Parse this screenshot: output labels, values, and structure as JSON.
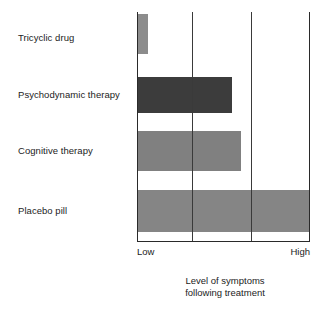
{
  "chart_data": {
    "type": "bar",
    "orientation": "horizontal",
    "title": "",
    "xlabel": "Level of symptoms following treatment",
    "ylabel": "",
    "categories": [
      "Tricyclic drug",
      "Psychodynamic therapy",
      "Cognitive therapy",
      "Placebo pill"
    ],
    "values": [
      6,
      55,
      60,
      100
    ],
    "xlim": [
      0,
      100
    ],
    "xtick_labels": [
      "Low",
      "High"
    ],
    "grid": true,
    "gridline_values": [
      32,
      66
    ],
    "legend": "none",
    "bar_colors": [
      "#8c8c8c",
      "#3c3c3c",
      "#808080",
      "#858585"
    ],
    "series": [
      {
        "name": "Level of symptoms following treatment",
        "values": [
          6,
          55,
          60,
          100
        ]
      }
    ]
  },
  "axis": {
    "tick_low": "Low",
    "tick_high": "High",
    "line_color": "#2a2a2a",
    "grid_color": "#3a3a3a"
  },
  "caption": {
    "line1": "Level of symptoms",
    "line2": "following treatment"
  },
  "bars": [
    {
      "label": "Tricyclic drug",
      "value": 6,
      "color": "#8c8c8c",
      "top": 2,
      "height": 40,
      "width_pct": 6.4,
      "label_top": 32
    },
    {
      "label": "Psychodynamic therapy",
      "value": 55,
      "color": "#3c3c3c",
      "top": 65,
      "height": 36,
      "width_pct": 55,
      "label_top": 89
    },
    {
      "label": "Cognitive therapy",
      "value": 60,
      "color": "#808080",
      "top": 119,
      "height": 40,
      "width_pct": 60,
      "label_top": 145
    },
    {
      "label": "Placebo pill",
      "value": 100,
      "color": "#858585",
      "top": 178,
      "height": 42,
      "width_pct": 100,
      "label_top": 205
    }
  ]
}
